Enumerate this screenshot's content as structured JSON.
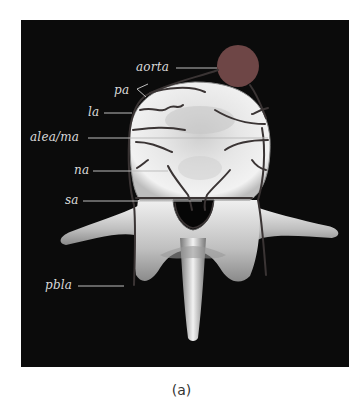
{
  "figure": {
    "caption": "(a)",
    "colors": {
      "background": "#0b0b0b",
      "bone": "#e8e8e8",
      "vessel": "#3a3434",
      "aorta": "#6e4646",
      "label_text": "#d9d9d9",
      "leader_line": "#bdbdbd"
    },
    "labels": [
      {
        "id": "aorta",
        "text": "aorta"
      },
      {
        "id": "pa",
        "text": "pa"
      },
      {
        "id": "la",
        "text": "la"
      },
      {
        "id": "alea_ma",
        "text": "alea/ma"
      },
      {
        "id": "na",
        "text": "na"
      },
      {
        "id": "sa",
        "text": "sa"
      },
      {
        "id": "pbla",
        "text": "pbla"
      }
    ],
    "structures": [
      "aorta",
      "vertebral-body",
      "spinal-canal",
      "left-transverse-process",
      "right-transverse-process",
      "spinous-process",
      "segmental-arteries"
    ]
  }
}
